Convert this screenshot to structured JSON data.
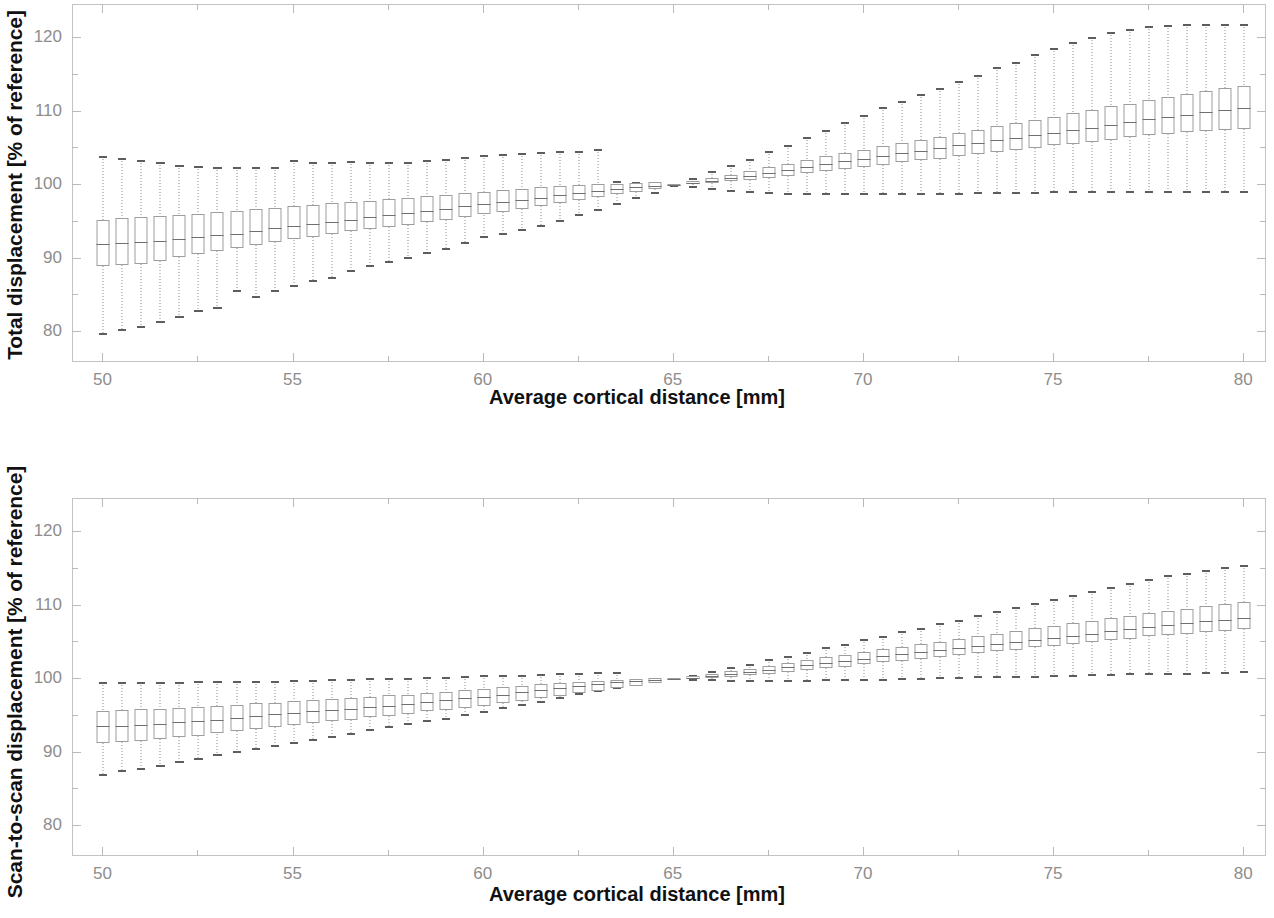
{
  "figure": {
    "panels": [
      {
        "id": "total-displacement",
        "ylabel": "Total displacement [% of reference]",
        "xlabel": "Average cortical distance [mm]"
      },
      {
        "id": "scan-to-scan-displacement",
        "ylabel": "Scan-to-scan displacement [% of reference]",
        "xlabel": "Average cortical distance [mm]"
      }
    ],
    "axis_colors": {
      "frame": "#c3c3c3",
      "tick_label": "#8d8d8d",
      "box_outline": "#9d9d9d",
      "whisker": "#8e8e8e",
      "median": "#6f6f6f",
      "title": "#111111"
    }
  },
  "chart_data": [
    {
      "type": "box",
      "title": "Total displacement [% of reference]",
      "xlabel": "Average cortical distance [mm]",
      "ylabel": "Total displacement [% of reference]",
      "xlim": [
        49.2,
        80.6
      ],
      "ylim": [
        75.8,
        124.5
      ],
      "xticks": [
        50,
        55,
        60,
        65,
        70,
        75,
        80
      ],
      "xtick_labels": [
        "50",
        "55",
        "60",
        "65",
        "70",
        "75",
        "80"
      ],
      "yticks": [
        80,
        90,
        100,
        110,
        120
      ],
      "ytick_labels": [
        "80",
        "90",
        "100",
        "110",
        "120"
      ],
      "yminor": [
        85,
        95,
        105,
        115
      ],
      "xminor": [
        52.5,
        57.5,
        62.5,
        67.5,
        72.5,
        77.5
      ],
      "grid": false,
      "legend": null,
      "reference_x": 65,
      "x": [
        50,
        50.5,
        51,
        51.5,
        52,
        52.5,
        53,
        53.5,
        54,
        54.5,
        55,
        55.5,
        56,
        56.5,
        57,
        57.5,
        58,
        58.5,
        59,
        59.5,
        60,
        60.5,
        61,
        61.5,
        62,
        62.5,
        63,
        63.5,
        64,
        64.5,
        65,
        65.5,
        66,
        66.5,
        67,
        67.5,
        68,
        68.5,
        69,
        69.5,
        70,
        70.5,
        71,
        71.5,
        72,
        72.5,
        73,
        73.5,
        74,
        74.5,
        75,
        75.5,
        76,
        76.5,
        77,
        77.5,
        78,
        78.5,
        79,
        79.5,
        80
      ],
      "median": [
        92.0,
        92.1,
        92.2,
        92.4,
        92.7,
        93.0,
        93.2,
        93.4,
        93.7,
        94.1,
        94.4,
        94.7,
        95.0,
        95.3,
        95.6,
        95.9,
        96.2,
        96.5,
        96.8,
        97.1,
        97.4,
        97.7,
        98.0,
        98.3,
        98.6,
        98.9,
        99.2,
        99.5,
        99.7,
        99.9,
        100.0,
        100.3,
        100.6,
        100.9,
        101.3,
        101.7,
        102.1,
        102.5,
        102.9,
        103.3,
        103.6,
        104.0,
        104.3,
        104.7,
        105.0,
        105.4,
        105.7,
        106.1,
        106.4,
        106.8,
        107.1,
        107.5,
        107.8,
        108.2,
        108.6,
        109.0,
        109.3,
        109.6,
        109.9,
        110.2,
        110.5
      ],
      "q1": [
        89.0,
        89.1,
        89.3,
        89.7,
        90.2,
        90.6,
        91.0,
        91.4,
        91.8,
        92.2,
        92.6,
        93.0,
        93.3,
        93.7,
        94.0,
        94.3,
        94.6,
        95.0,
        95.3,
        95.7,
        96.0,
        96.4,
        96.8,
        97.2,
        97.6,
        98.0,
        98.4,
        98.8,
        99.1,
        99.5,
        99.9,
        100.1,
        100.3,
        100.5,
        100.7,
        101.0,
        101.3,
        101.6,
        101.9,
        102.2,
        102.5,
        102.8,
        103.1,
        103.4,
        103.6,
        103.9,
        104.2,
        104.5,
        104.8,
        105.1,
        105.4,
        105.6,
        105.9,
        106.2,
        106.5,
        106.8,
        107.0,
        107.2,
        107.4,
        107.5,
        107.6
      ],
      "q3": [
        95.3,
        95.5,
        95.6,
        95.8,
        96.0,
        96.1,
        96.3,
        96.5,
        96.7,
        96.9,
        97.1,
        97.3,
        97.5,
        97.7,
        97.9,
        98.1,
        98.3,
        98.5,
        98.7,
        98.9,
        99.1,
        99.3,
        99.5,
        99.7,
        99.9,
        100.0,
        100.1,
        100.2,
        100.3,
        100.4,
        100.1,
        100.6,
        101.0,
        101.4,
        101.9,
        102.4,
        102.9,
        103.4,
        103.9,
        104.4,
        104.8,
        105.3,
        105.7,
        106.2,
        106.6,
        107.1,
        107.5,
        108.0,
        108.4,
        108.9,
        109.3,
        109.8,
        110.2,
        110.7,
        111.1,
        111.6,
        112.0,
        112.4,
        112.8,
        113.2,
        113.5
      ],
      "whisker_low": [
        79.6,
        80.1,
        80.6,
        81.3,
        81.9,
        82.7,
        83.2,
        85.5,
        84.6,
        85.5,
        86.1,
        86.8,
        87.2,
        88.2,
        88.8,
        89.4,
        90.0,
        90.6,
        91.2,
        92.0,
        92.8,
        93.2,
        93.7,
        94.3,
        95.0,
        95.8,
        96.5,
        97.3,
        98.1,
        98.8,
        99.8,
        99.6,
        99.3,
        99.1,
        98.9,
        98.8,
        98.7,
        98.7,
        98.7,
        98.7,
        98.7,
        98.7,
        98.7,
        98.7,
        98.7,
        98.7,
        98.8,
        98.8,
        98.8,
        98.8,
        98.9,
        98.9,
        98.9,
        98.9,
        98.9,
        98.9,
        98.9,
        98.9,
        98.9,
        98.9,
        98.9
      ],
      "whisker_high": [
        104.0,
        103.7,
        103.4,
        103.1,
        102.8,
        102.6,
        102.5,
        102.5,
        102.4,
        102.4,
        103.4,
        103.1,
        103.1,
        103.3,
        103.1,
        103.2,
        103.2,
        103.4,
        103.5,
        103.8,
        104.1,
        104.2,
        104.3,
        104.5,
        104.6,
        104.7,
        104.9,
        100.6,
        100.4,
        100.3,
        100.2,
        101.0,
        101.9,
        102.7,
        103.6,
        104.6,
        105.5,
        106.6,
        107.5,
        108.6,
        109.5,
        110.6,
        111.4,
        112.4,
        113.2,
        114.2,
        115.0,
        116.0,
        116.8,
        117.8,
        118.6,
        119.5,
        120.1,
        120.8,
        121.3,
        121.6,
        121.8,
        121.9,
        121.9,
        121.9,
        121.9
      ]
    },
    {
      "type": "box",
      "title": "Scan-to-scan displacement [% of reference]",
      "xlabel": "Average cortical distance [mm]",
      "ylabel": "Scan-to-scan displacement [% of reference]",
      "xlim": [
        49.2,
        80.6
      ],
      "ylim": [
        75.8,
        124.5
      ],
      "xticks": [
        50,
        55,
        60,
        65,
        70,
        75,
        80
      ],
      "xtick_labels": [
        "50",
        "55",
        "60",
        "65",
        "70",
        "75",
        "80"
      ],
      "yticks": [
        80,
        90,
        100,
        110,
        120
      ],
      "ytick_labels": [
        "80",
        "90",
        "100",
        "110",
        "120"
      ],
      "yminor": [
        85,
        95,
        105,
        115
      ],
      "xminor": [
        52.5,
        57.5,
        62.5,
        67.5,
        72.5,
        77.5
      ],
      "grid": false,
      "legend": null,
      "reference_x": 65,
      "x": [
        50,
        50.5,
        51,
        51.5,
        52,
        52.5,
        53,
        53.5,
        54,
        54.5,
        55,
        55.5,
        56,
        56.5,
        57,
        57.5,
        58,
        58.5,
        59,
        59.5,
        60,
        60.5,
        61,
        61.5,
        62,
        62.5,
        63,
        63.5,
        64,
        64.5,
        65,
        65.5,
        66,
        66.5,
        67,
        67.5,
        68,
        68.5,
        69,
        69.5,
        70,
        70.5,
        71,
        71.5,
        72,
        72.5,
        73,
        73.5,
        74,
        74.5,
        75,
        75.5,
        76,
        76.5,
        77,
        77.5,
        78,
        78.5,
        79,
        79.5,
        80
      ],
      "median": [
        93.6,
        93.6,
        93.7,
        93.9,
        94.1,
        94.3,
        94.5,
        94.7,
        95.0,
        95.2,
        95.4,
        95.6,
        95.8,
        96.0,
        96.2,
        96.4,
        96.6,
        96.9,
        97.1,
        97.4,
        97.6,
        97.9,
        98.2,
        98.5,
        98.8,
        99.1,
        99.3,
        99.6,
        99.8,
        99.9,
        100.0,
        100.2,
        100.4,
        100.7,
        101.0,
        101.3,
        101.6,
        101.9,
        102.2,
        102.5,
        102.8,
        103.1,
        103.4,
        103.7,
        104.0,
        104.2,
        104.5,
        104.8,
        105.1,
        105.3,
        105.6,
        105.9,
        106.2,
        106.5,
        106.8,
        107.1,
        107.4,
        107.6,
        107.9,
        108.1,
        108.3
      ],
      "q1": [
        91.3,
        91.4,
        91.6,
        91.8,
        92.1,
        92.3,
        92.6,
        92.9,
        93.2,
        93.5,
        93.8,
        94.0,
        94.3,
        94.5,
        94.8,
        95.0,
        95.3,
        95.6,
        95.8,
        96.1,
        96.4,
        96.7,
        97.0,
        97.4,
        97.7,
        98.1,
        98.4,
        98.8,
        99.1,
        99.5,
        99.9,
        100.0,
        100.1,
        100.3,
        100.5,
        100.7,
        101.0,
        101.2,
        101.5,
        101.7,
        102.0,
        102.3,
        102.5,
        102.8,
        103.0,
        103.3,
        103.5,
        103.8,
        104.0,
        104.3,
        104.5,
        104.8,
        105.0,
        105.3,
        105.5,
        105.8,
        106.0,
        106.2,
        106.4,
        106.6,
        106.8
      ],
      "q3": [
        95.7,
        95.8,
        95.9,
        96.0,
        96.1,
        96.2,
        96.4,
        96.5,
        96.7,
        96.8,
        97.0,
        97.1,
        97.3,
        97.4,
        97.6,
        97.8,
        97.9,
        98.1,
        98.3,
        98.5,
        98.7,
        98.9,
        99.1,
        99.3,
        99.5,
        99.6,
        99.8,
        99.9,
        100.0,
        100.1,
        100.1,
        100.4,
        100.7,
        101.1,
        101.4,
        101.8,
        102.2,
        102.6,
        103.0,
        103.3,
        103.7,
        104.1,
        104.4,
        104.8,
        105.1,
        105.5,
        105.8,
        106.2,
        106.5,
        106.9,
        107.2,
        107.6,
        107.9,
        108.3,
        108.6,
        109.0,
        109.3,
        109.6,
        109.9,
        110.2,
        110.5
      ],
      "whisker_low": [
        86.8,
        87.3,
        87.7,
        88.1,
        88.6,
        89.0,
        89.5,
        89.9,
        90.3,
        90.7,
        91.2,
        91.6,
        92.0,
        92.4,
        92.9,
        93.3,
        93.7,
        94.1,
        94.5,
        95.0,
        95.4,
        95.9,
        96.3,
        96.8,
        97.3,
        97.8,
        98.2,
        98.7,
        99.1,
        99.5,
        99.9,
        99.8,
        99.7,
        99.6,
        99.6,
        99.6,
        99.6,
        99.6,
        99.7,
        99.7,
        99.8,
        99.8,
        99.9,
        99.9,
        100.0,
        100.0,
        100.1,
        100.1,
        100.2,
        100.2,
        100.3,
        100.3,
        100.4,
        100.4,
        100.5,
        100.5,
        100.6,
        100.6,
        100.7,
        100.7,
        100.8
      ],
      "whisker_high": [
        99.6,
        99.6,
        99.6,
        99.6,
        99.6,
        99.7,
        99.7,
        99.7,
        99.8,
        99.8,
        99.9,
        99.9,
        100.0,
        100.0,
        100.1,
        100.1,
        100.2,
        100.3,
        100.3,
        100.4,
        100.5,
        100.6,
        100.6,
        100.7,
        100.8,
        100.8,
        100.9,
        100.9,
        100.0,
        100.0,
        100.1,
        100.6,
        101.1,
        101.6,
        102.1,
        102.7,
        103.2,
        103.7,
        104.3,
        104.8,
        105.4,
        105.9,
        106.5,
        107.0,
        107.6,
        108.1,
        108.7,
        109.2,
        109.8,
        110.3,
        110.9,
        111.4,
        112.0,
        112.5,
        113.1,
        113.6,
        114.1,
        114.5,
        114.9,
        115.2,
        115.5
      ]
    }
  ]
}
